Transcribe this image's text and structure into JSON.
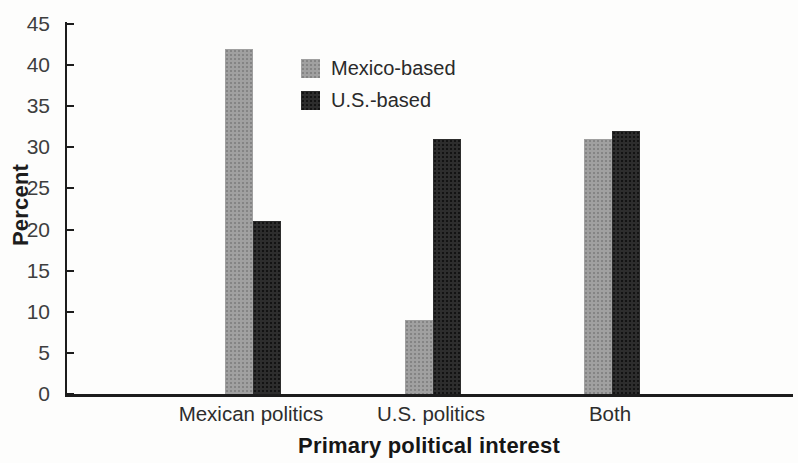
{
  "chart_data": {
    "type": "bar",
    "categories": [
      "Mexican politics",
      "U.S. politics",
      "Both"
    ],
    "series": [
      {
        "name": "Mexico-based",
        "color": "#a0a0a0",
        "dot_color": "#848484",
        "values": [
          42,
          9,
          31
        ]
      },
      {
        "name": "U.S.-based",
        "color": "#2d2d2d",
        "dot_color": "#131313",
        "values": [
          21,
          31,
          32
        ]
      }
    ],
    "title": "",
    "xlabel": "Primary political interest",
    "ylabel": "Percent",
    "ylim": [
      0,
      45
    ],
    "ytick_step": 5,
    "ytick_labels": [
      "0",
      "5",
      "10",
      "15",
      "20",
      "25",
      "30",
      "35",
      "40",
      "45"
    ],
    "grid": false,
    "legend_position": "upper-center-left"
  },
  "colors": {
    "axis": "#1c1c1c",
    "tick_text": "#3e3e3e",
    "label_text": "#2d2d2d",
    "background": "#fdfdfc"
  }
}
